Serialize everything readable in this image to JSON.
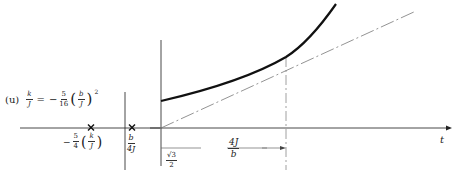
{
  "figure": {
    "panel_label": "(u)",
    "equation": {
      "lhs_num": "k",
      "lhs_den": "J",
      "equals": "=",
      "sign": "−",
      "coef_num": "5",
      "coef_den": "16",
      "inner_num": "b",
      "inner_den": "J",
      "exponent": "2"
    },
    "left_panel": {
      "marker_1": {
        "symbol": "×",
        "label_sign": "−",
        "label_coef_num": "5",
        "label_coef_den": "4",
        "label_inner_num": "k",
        "label_inner_den": "J"
      },
      "marker_2": {
        "symbol": "×",
        "label_num": "b",
        "label_den": "4J"
      }
    },
    "right_panel": {
      "x_axis_label": "t",
      "interval_label_num": "4J",
      "interval_label_den": "b",
      "intercept_label_num": "√3",
      "intercept_label_den": "2"
    }
  },
  "colors": {
    "curve": "#111111",
    "axis": "#333333",
    "dashed": "#777777"
  }
}
